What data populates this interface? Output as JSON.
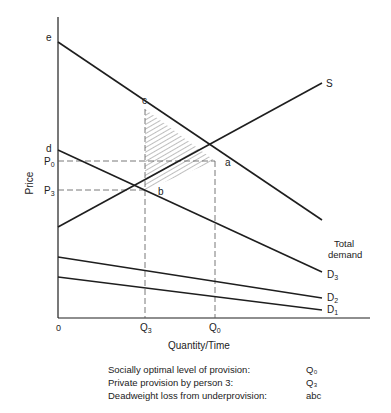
{
  "diagram": {
    "type": "public-good-provision",
    "axes": {
      "y_label": "Price",
      "x_label": "Quantity/Time",
      "origin_label": "0"
    },
    "price_ticks": [
      {
        "id": "p0",
        "label": "P",
        "sub": "0"
      },
      {
        "id": "p3",
        "label": "P",
        "sub": "3"
      }
    ],
    "quantity_ticks": [
      {
        "id": "q3",
        "label": "Q",
        "sub": "3"
      },
      {
        "id": "q0",
        "label": "Q",
        "sub": "0"
      }
    ],
    "points": {
      "e": "e",
      "d": "d",
      "c": "c",
      "a": "a",
      "b": "b"
    },
    "curves": {
      "supply": "S",
      "total_demand_line1": "Total",
      "total_demand_line2": "demand",
      "d3": {
        "label": "D",
        "sub": "3"
      },
      "d2": {
        "label": "D",
        "sub": "2"
      },
      "d1": {
        "label": "D",
        "sub": "1"
      }
    },
    "shaded_region": "abc",
    "colors": {
      "line": "#1e1e1e",
      "dashed": "#555555",
      "hatch": "#444444"
    }
  },
  "legend": [
    {
      "key": "Socially optimal level of provision:",
      "value": "Q₀"
    },
    {
      "key": "Private provision by person 3:",
      "value": "Q₃"
    },
    {
      "key": "Deadweight loss from underprovision:",
      "value": "abc"
    }
  ]
}
